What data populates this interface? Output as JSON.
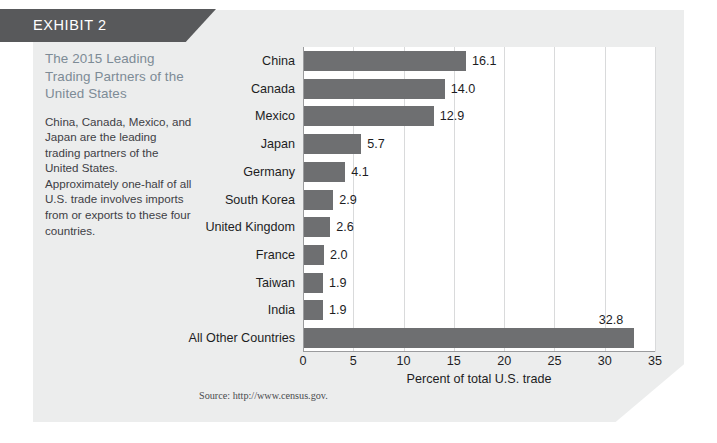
{
  "banner": {
    "label": "EXHIBIT 2"
  },
  "sidebar": {
    "title": "The 2015 Leading Trading Partners of the United States",
    "body": "China, Canada, Mexico, and Japan are the leading trading partners of the United States. Approximately one-half of all U.S. trade involves imports from or exports to these four countries."
  },
  "source": {
    "text": "Source: http://www.census.gov."
  },
  "colors": {
    "banner": "#58595b",
    "card": "#eceded",
    "bar": "#6e6f71",
    "title": "#7d8b96",
    "grid": "#d9dadb",
    "axis": "#9a9b9d",
    "plot_background": "#ffffff"
  },
  "chart_data": {
    "type": "bar",
    "orientation": "horizontal",
    "title": "The 2015 Leading Trading Partners of the United States",
    "xlabel": "Percent of total U.S. trade",
    "ylabel": "",
    "categories": [
      "China",
      "Canada",
      "Mexico",
      "Japan",
      "Germany",
      "South Korea",
      "United Kingdom",
      "France",
      "Taiwan",
      "India",
      "All Other Countries"
    ],
    "values": [
      16.1,
      14.0,
      12.9,
      5.7,
      4.1,
      2.9,
      2.6,
      2.0,
      1.9,
      1.9,
      32.8
    ],
    "value_labels": [
      "16.1",
      "14.0",
      "12.9",
      "5.7",
      "4.1",
      "2.9",
      "2.6",
      "2.0",
      "1.9",
      "1.9",
      "32.8"
    ],
    "xlim": [
      0,
      35
    ],
    "xticks": [
      0,
      5,
      10,
      15,
      20,
      25,
      30,
      35
    ],
    "xtick_labels": [
      "0",
      "5",
      "10",
      "15",
      "20",
      "25",
      "30",
      "35"
    ],
    "grid": true,
    "legend": false
  }
}
